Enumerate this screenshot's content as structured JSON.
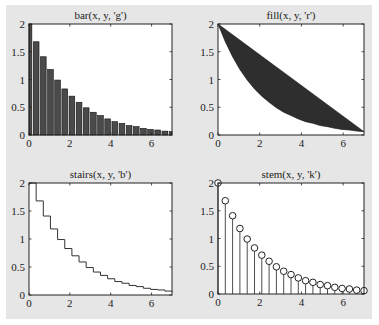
{
  "figure": {
    "background": "#e6e6e6"
  },
  "chart_data": [
    {
      "type": "bar",
      "title": "bar(x, y, 'g')",
      "xlabel": "",
      "ylabel": "",
      "xlim": [
        0,
        7
      ],
      "ylim": [
        0,
        2
      ],
      "xticks": [
        "0",
        "2",
        "4",
        "6"
      ],
      "yticks": [
        "0",
        "0.5",
        "1",
        "1.5",
        "2"
      ],
      "x": [
        0,
        0.35,
        0.7,
        1.05,
        1.4,
        1.75,
        2.1,
        2.45,
        2.8,
        3.15,
        3.5,
        3.85,
        4.2,
        4.55,
        4.9,
        5.25,
        5.6,
        5.95,
        6.3,
        6.65,
        7.0
      ],
      "values": [
        2.0,
        1.68,
        1.41,
        1.18,
        0.99,
        0.83,
        0.7,
        0.59,
        0.49,
        0.41,
        0.35,
        0.29,
        0.24,
        0.21,
        0.17,
        0.15,
        0.12,
        0.1,
        0.09,
        0.07,
        0.06
      ],
      "color": "#4a4a4a",
      "grid": false
    },
    {
      "type": "area",
      "title": "fill(x, y, 'r')",
      "xlabel": "",
      "ylabel": "",
      "xlim": [
        0,
        7
      ],
      "ylim": [
        0,
        2
      ],
      "xticks": [
        "0",
        "2",
        "4",
        "6"
      ],
      "yticks": [
        "0",
        "0.5",
        "1",
        "1.5",
        "2"
      ],
      "x": [
        0,
        0.35,
        0.7,
        1.05,
        1.4,
        1.75,
        2.1,
        2.45,
        2.8,
        3.15,
        3.5,
        3.85,
        4.2,
        4.55,
        4.9,
        5.25,
        5.6,
        5.95,
        6.3,
        6.65,
        7.0
      ],
      "values": [
        2.0,
        1.68,
        1.41,
        1.18,
        0.99,
        0.83,
        0.7,
        0.59,
        0.49,
        0.41,
        0.35,
        0.29,
        0.24,
        0.21,
        0.17,
        0.15,
        0.12,
        0.1,
        0.09,
        0.07,
        0.06
      ],
      "color": "#2e2e2e",
      "grid": false
    },
    {
      "type": "line",
      "subtype": "stairs",
      "title": "stairs(x, y, 'b')",
      "xlabel": "",
      "ylabel": "",
      "xlim": [
        0,
        7
      ],
      "ylim": [
        0,
        2
      ],
      "xticks": [
        "0",
        "2",
        "4",
        "6"
      ],
      "yticks": [
        "0",
        "0.5",
        "1",
        "1.5",
        "2"
      ],
      "x": [
        0,
        0.35,
        0.7,
        1.05,
        1.4,
        1.75,
        2.1,
        2.45,
        2.8,
        3.15,
        3.5,
        3.85,
        4.2,
        4.55,
        4.9,
        5.25,
        5.6,
        5.95,
        6.3,
        6.65,
        7.0
      ],
      "values": [
        2.0,
        1.68,
        1.41,
        1.18,
        0.99,
        0.83,
        0.7,
        0.59,
        0.49,
        0.41,
        0.35,
        0.29,
        0.24,
        0.21,
        0.17,
        0.15,
        0.12,
        0.1,
        0.09,
        0.07,
        0.06
      ],
      "color": "#333333",
      "grid": false
    },
    {
      "type": "scatter",
      "subtype": "stem",
      "title": "stem(x, y, 'k')",
      "xlabel": "",
      "ylabel": "",
      "xlim": [
        0,
        7
      ],
      "ylim": [
        0,
        2
      ],
      "xticks": [
        "0",
        "2",
        "4",
        "6"
      ],
      "yticks": [
        "0",
        "0.5",
        "1",
        "1.5",
        "2"
      ],
      "x": [
        0,
        0.35,
        0.7,
        1.05,
        1.4,
        1.75,
        2.1,
        2.45,
        2.8,
        3.15,
        3.5,
        3.85,
        4.2,
        4.55,
        4.9,
        5.25,
        5.6,
        5.95,
        6.3,
        6.65,
        7.0
      ],
      "values": [
        2.0,
        1.68,
        1.41,
        1.18,
        0.99,
        0.83,
        0.7,
        0.59,
        0.49,
        0.41,
        0.35,
        0.29,
        0.24,
        0.21,
        0.17,
        0.15,
        0.12,
        0.1,
        0.09,
        0.07,
        0.06
      ],
      "color": "#222222",
      "grid": false
    }
  ]
}
